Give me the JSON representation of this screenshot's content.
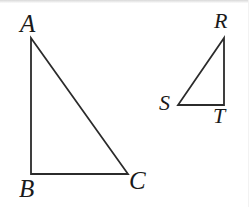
{
  "figure": {
    "background_color": "#ffffff",
    "stroke_color": "#2b2b2b",
    "stroke_width": 1.8,
    "label_color": "#1a1a1a"
  },
  "shapes": {
    "large_triangle": {
      "name": "triangle ABC",
      "vertices": [
        {
          "label": "A",
          "x": 31,
          "y": 38
        },
        {
          "label": "B",
          "x": 31,
          "y": 174
        },
        {
          "label": "C",
          "x": 128,
          "y": 174
        }
      ]
    },
    "small_triangle": {
      "name": "triangle RST",
      "vertices": [
        {
          "label": "R",
          "x": 224,
          "y": 38
        },
        {
          "label": "S",
          "x": 178,
          "y": 105
        },
        {
          "label": "T",
          "x": 224,
          "y": 105
        }
      ]
    }
  },
  "labels": {
    "A": "A",
    "B": "B",
    "C": "C",
    "R": "R",
    "S": "S",
    "T": "T"
  }
}
